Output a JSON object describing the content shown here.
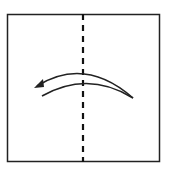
{
  "diagram": {
    "type": "origami-fold-step",
    "top_caption_cropped": "",
    "paper_square": {
      "x": 7,
      "y": 14,
      "width": 153,
      "height": 148,
      "stroke": "#222222"
    },
    "fold_line": {
      "style": "dashed",
      "x": 83,
      "y1": 14,
      "y2": 162,
      "color": "#111111"
    },
    "arrow": {
      "direction": "right-to-left",
      "meaning": "fold right half over to the left",
      "color": "#222222"
    }
  }
}
